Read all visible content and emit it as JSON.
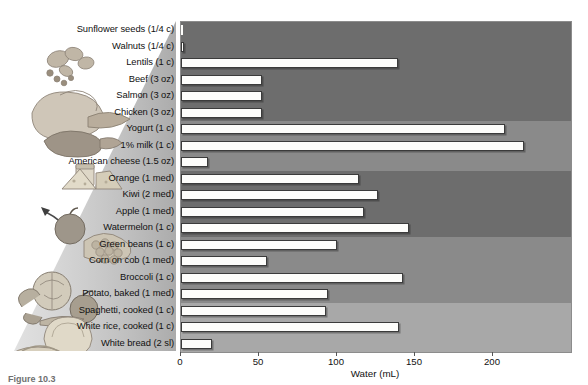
{
  "figure": {
    "caption": "Figure 10.3",
    "axis_title": "Water (mL)"
  },
  "chart_data": {
    "type": "bar",
    "orientation": "horizontal",
    "title": "",
    "xlabel": "Water (mL)",
    "ylabel": "",
    "xlim": [
      0,
      250
    ],
    "ticks": [
      0,
      50,
      100,
      150,
      200
    ],
    "tick_labels": [
      "0",
      "50",
      "100",
      "150",
      "200"
    ],
    "grid": false,
    "legend": "none",
    "bar_fill": "#fdfdfb",
    "bar_edge": "#3b3b3b",
    "categories": [
      "Sunflower seeds (1/4 c)",
      "Walnuts (1/4 c)",
      "Lentils (1 c)",
      "Beef (3 oz)",
      "Salmon (3 oz)",
      "Chicken (3 oz)",
      "Yogurt (1 c)",
      "1% milk (1 c)",
      "American cheese (1.5 oz)",
      "Orange (1 med)",
      "Kiwi (2 med)",
      "Apple (1 med)",
      "Watermelon (1 c)",
      "Green beans (1 c)",
      "Corn on cob (1 med)",
      "Broccoli (1 c)",
      "Potato, baked (1 med)",
      "Spaghetti, cooked (1 c)",
      "White rice, cooked (1 c)",
      "White bread (2 sl)"
    ],
    "values": [
      1,
      2,
      139,
      52,
      52,
      52,
      208,
      220,
      17,
      114,
      126,
      117,
      146,
      100,
      55,
      142,
      94,
      93,
      140,
      20
    ],
    "group_bands": [
      {
        "name": "protein-foods",
        "start_index": 0,
        "end_index": 5,
        "color": "#6d6d6d"
      },
      {
        "name": "dairy",
        "start_index": 6,
        "end_index": 8,
        "color": "#8a8a8a"
      },
      {
        "name": "fruits",
        "start_index": 9,
        "end_index": 12,
        "color": "#6d6d6d"
      },
      {
        "name": "vegetables",
        "start_index": 13,
        "end_index": 16,
        "color": "#8a8a8a"
      },
      {
        "name": "grains",
        "start_index": 17,
        "end_index": 19,
        "color": "#a8a8a8"
      }
    ]
  }
}
